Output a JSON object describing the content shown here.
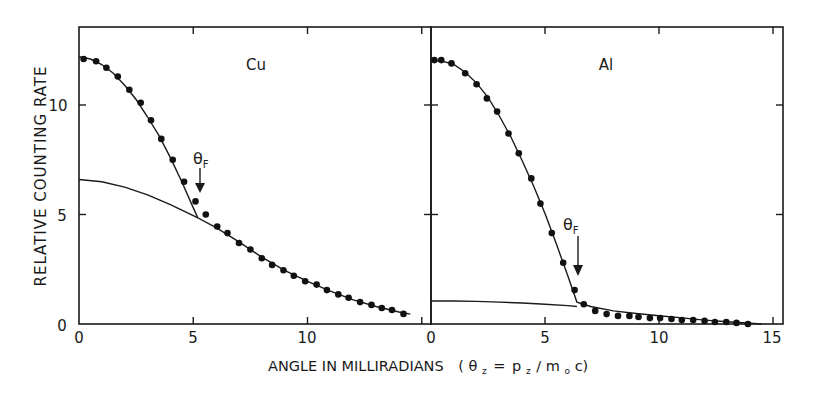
{
  "chart_data": {
    "type": "scatter",
    "layout": "two panels side by side sharing y-axis",
    "ylabel": "RELATIVE COUNTING RATE",
    "xlabel": "ANGLE IN MILLIRADIANS",
    "xlabel_formula": "(θz = pz/m0c)",
    "ylim": [
      0,
      13.5
    ],
    "yticks": [
      0,
      5,
      10
    ],
    "grid": false,
    "legend": "none",
    "panels": [
      {
        "label": "Cu",
        "xlim": [
          0,
          15
        ],
        "xticks": [
          0,
          5,
          10
        ],
        "annotation": {
          "text": "θF",
          "x": 5.3,
          "y": 5.5
        },
        "series": [
          {
            "name": "measured",
            "style": "points",
            "x": [
              0.2,
              0.75,
              1.2,
              1.7,
              2.2,
              2.7,
              3.15,
              3.6,
              4.1,
              4.6,
              5.1,
              5.55,
              6.05,
              6.5,
              7.0,
              7.5,
              8.0,
              8.45,
              8.95,
              9.4,
              9.9,
              10.4,
              10.85,
              11.35,
              11.8,
              12.3,
              12.8,
              13.25,
              13.7,
              14.2
            ],
            "y": [
              12.1,
              12.0,
              11.7,
              11.3,
              10.7,
              10.1,
              9.3,
              8.45,
              7.5,
              6.5,
              5.6,
              5.0,
              4.45,
              4.15,
              3.7,
              3.4,
              3.0,
              2.7,
              2.45,
              2.2,
              1.95,
              1.8,
              1.55,
              1.35,
              1.2,
              1.0,
              0.87,
              0.73,
              0.64,
              0.46
            ]
          },
          {
            "name": "fit (total)",
            "style": "line",
            "x": [
              0,
              0.5,
              1,
              1.5,
              2,
              2.5,
              3,
              3.5,
              4,
              4.5,
              5,
              5.2,
              6,
              7,
              8,
              9,
              10,
              11,
              12,
              13,
              14,
              14.5
            ],
            "y": [
              12.2,
              12.1,
              11.85,
              11.45,
              10.9,
              10.25,
              9.45,
              8.6,
              7.6,
              6.5,
              5.3,
              4.85,
              4.4,
              3.75,
              3.05,
              2.45,
              1.95,
              1.5,
              1.1,
              0.8,
              0.55,
              0.45
            ]
          },
          {
            "name": "core contribution",
            "style": "line",
            "x": [
              0,
              1,
              2,
              3,
              4,
              5,
              5.2
            ],
            "y": [
              6.6,
              6.5,
              6.25,
              5.9,
              5.45,
              4.95,
              4.85
            ]
          }
        ]
      },
      {
        "label": "Al",
        "xlim": [
          0,
          15.4
        ],
        "xticks": [
          0,
          5,
          10,
          15
        ],
        "annotation": {
          "text": "θF",
          "x": 6.5,
          "y": 2.2
        },
        "series": [
          {
            "name": "measured",
            "style": "points",
            "x": [
              0.15,
              0.45,
              0.9,
              1.5,
              2.0,
              2.45,
              2.9,
              3.4,
              3.85,
              4.4,
              4.8,
              5.3,
              5.8,
              6.3,
              6.7,
              7.2,
              7.7,
              8.2,
              8.7,
              9.1,
              9.6,
              10.05,
              10.55,
              11.0,
              11.5,
              12.0,
              12.45,
              12.95,
              13.4,
              13.9
            ],
            "y": [
              12.05,
              12.05,
              11.9,
              11.45,
              10.95,
              10.3,
              9.7,
              8.7,
              7.8,
              6.65,
              5.5,
              4.15,
              2.8,
              1.55,
              0.9,
              0.6,
              0.45,
              0.37,
              0.37,
              0.32,
              0.27,
              0.27,
              0.23,
              0.18,
              0.18,
              0.14,
              0.09,
              0.09,
              0.05,
              0.0
            ]
          },
          {
            "name": "fit (total)",
            "style": "line",
            "x": [
              0,
              0.5,
              1,
              1.5,
              2,
              2.5,
              3,
              3.5,
              4,
              4.5,
              5,
              5.5,
              6,
              6.4,
              7,
              8,
              9,
              10,
              11,
              12,
              13,
              14,
              14.5
            ],
            "y": [
              12.05,
              12.0,
              11.85,
              11.5,
              11.0,
              10.35,
              9.5,
              8.55,
              7.45,
              6.3,
              5.05,
              3.65,
              2.2,
              1.0,
              0.8,
              0.6,
              0.48,
              0.38,
              0.28,
              0.18,
              0.1,
              0.03,
              0.0
            ]
          },
          {
            "name": "core contribution",
            "style": "line",
            "x": [
              0,
              1,
              2,
              3,
              4,
              5,
              6,
              6.4
            ],
            "y": [
              1.05,
              1.05,
              1.03,
              1.0,
              0.96,
              0.9,
              0.84,
              0.8
            ]
          }
        ]
      }
    ]
  },
  "labels": {
    "ylabel": "RELATIVE COUNTING RATE",
    "xlabel_text": "ANGLE IN MILLIRADIANS",
    "xlabel_paren_open": "(",
    "theta": "θ",
    "z": "z",
    "equals": "=",
    "p": "p",
    "slash": "/",
    "m": "m",
    "o": "o",
    "c": "c)",
    "panel_left": "Cu",
    "panel_right": "Al",
    "thetaF_main": "θ",
    "thetaF_sub": "F",
    "yticks": [
      "0",
      "5",
      "10"
    ],
    "xticks_left": [
      "0",
      "5",
      "10"
    ],
    "xticks_right": [
      "0",
      "5",
      "10",
      "15"
    ]
  }
}
